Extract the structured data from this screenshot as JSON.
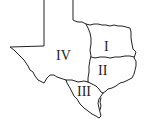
{
  "map": {
    "subject": "Texas",
    "colors": {
      "background": "#ffffff",
      "line": "#222222",
      "text": "#222222"
    },
    "regions": [
      {
        "id": "I",
        "label": "I",
        "x": 108,
        "y": 47
      },
      {
        "id": "II",
        "label": "II",
        "x": 106,
        "y": 75
      },
      {
        "id": "III",
        "label": "III",
        "x": 86,
        "y": 94
      },
      {
        "id": "IV",
        "label": "IV",
        "x": 67,
        "y": 55
      }
    ]
  }
}
